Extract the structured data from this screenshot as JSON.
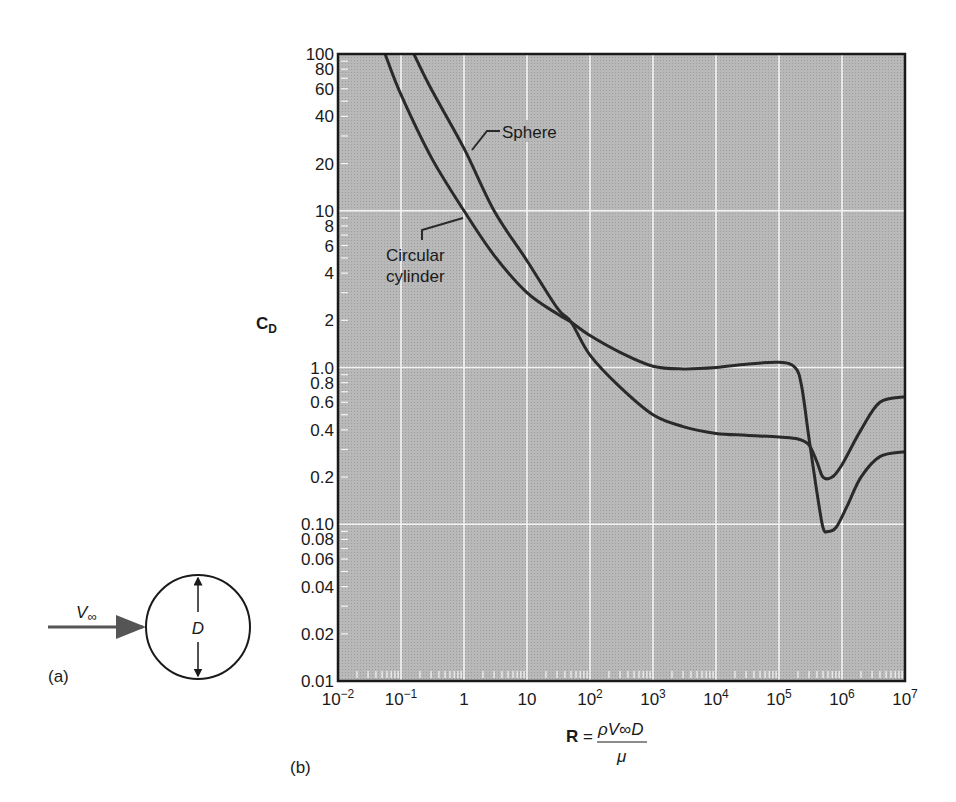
{
  "chart_data": {
    "type": "line",
    "title": "",
    "xlabel": "R = ρV∞D / μ",
    "ylabel": "C_D",
    "x_scale": "log",
    "y_scale": "log",
    "xlim": [
      0.01,
      10000000
    ],
    "ylim": [
      0.01,
      100
    ],
    "grid": true,
    "x_ticks": [
      {
        "value": 0.01,
        "base": "10",
        "exp": "−2"
      },
      {
        "value": 0.1,
        "base": "10",
        "exp": "−1"
      },
      {
        "value": 1,
        "base": "1",
        "exp": ""
      },
      {
        "value": 10,
        "base": "10",
        "exp": ""
      },
      {
        "value": 100,
        "base": "10",
        "exp": "2"
      },
      {
        "value": 1000,
        "base": "10",
        "exp": "3"
      },
      {
        "value": 10000,
        "base": "10",
        "exp": "4"
      },
      {
        "value": 100000,
        "base": "10",
        "exp": "5"
      },
      {
        "value": 1000000,
        "base": "10",
        "exp": "6"
      },
      {
        "value": 10000000,
        "base": "10",
        "exp": "7"
      }
    ],
    "y_ticks": [
      {
        "value": 100,
        "label": "100"
      },
      {
        "value": 80,
        "label": "80"
      },
      {
        "value": 60,
        "label": "60"
      },
      {
        "value": 40,
        "label": "40"
      },
      {
        "value": 20,
        "label": "20"
      },
      {
        "value": 10,
        "label": "10"
      },
      {
        "value": 8,
        "label": "8"
      },
      {
        "value": 6,
        "label": "6"
      },
      {
        "value": 4,
        "label": "4"
      },
      {
        "value": 2,
        "label": "2"
      },
      {
        "value": 1,
        "label": "1.0"
      },
      {
        "value": 0.8,
        "label": "0.8"
      },
      {
        "value": 0.6,
        "label": "0.6"
      },
      {
        "value": 0.4,
        "label": "0.4"
      },
      {
        "value": 0.2,
        "label": "0.2"
      },
      {
        "value": 0.1,
        "label": "0.10"
      },
      {
        "value": 0.08,
        "label": "0.08"
      },
      {
        "value": 0.06,
        "label": "0.06"
      },
      {
        "value": 0.04,
        "label": "0.04"
      },
      {
        "value": 0.02,
        "label": "0.02"
      },
      {
        "value": 0.01,
        "label": "0.01"
      }
    ],
    "series": [
      {
        "name": "Circular cylinder",
        "x": [
          0.056,
          0.1,
          0.3,
          1,
          3,
          10,
          30,
          50,
          100,
          300,
          1000,
          3000,
          10000,
          30000,
          100000,
          180000,
          230000,
          300000,
          400000,
          500000,
          600000,
          800000,
          1200000,
          2000000,
          4000000,
          10000000
        ],
        "y": [
          100,
          55,
          22,
          10,
          5.2,
          3.0,
          2.2,
          1.95,
          1.6,
          1.25,
          1.02,
          0.98,
          1.0,
          1.05,
          1.08,
          1.0,
          0.75,
          0.35,
          0.16,
          0.095,
          0.09,
          0.095,
          0.13,
          0.2,
          0.27,
          0.29
        ]
      },
      {
        "name": "Sphere",
        "x": [
          0.16,
          0.3,
          1,
          3,
          10,
          30,
          50,
          100,
          300,
          1000,
          3000,
          10000,
          30000,
          100000,
          200000,
          300000,
          400000,
          500000,
          700000,
          1000000,
          2000000,
          4000000,
          10000000
        ],
        "y": [
          100,
          60,
          25,
          10,
          4.8,
          2.4,
          1.95,
          1.2,
          0.75,
          0.5,
          0.42,
          0.38,
          0.37,
          0.36,
          0.35,
          0.32,
          0.25,
          0.2,
          0.2,
          0.24,
          0.4,
          0.6,
          0.65
        ]
      }
    ],
    "annotations": [
      {
        "text": "Sphere",
        "x": 30,
        "y": 30
      },
      {
        "text_lines": [
          "Circular",
          "cylinder"
        ],
        "x": 3,
        "y": 5
      }
    ]
  },
  "figure": {
    "panel_a_label": "(a)",
    "panel_b_label": "(b)",
    "velocity_symbol": "V",
    "velocity_subscript": "∞",
    "diameter_symbol": "D",
    "y_axis_label_main": "C",
    "y_axis_label_sub": "D",
    "x_axis_label_lhs": "R",
    "x_axis_label_eq": "=",
    "x_axis_numerator": "ρV∞D",
    "x_axis_denominator": "μ",
    "sphere_label": "Sphere",
    "cylinder_label_line1": "Circular",
    "cylinder_label_line2": "cylinder",
    "colors": {
      "plot_background": "#b4b4b4",
      "grid": "#f4f4f4",
      "curve": "#2a2a2a",
      "axis": "#1a1a1a",
      "arrow": "#555555"
    }
  }
}
